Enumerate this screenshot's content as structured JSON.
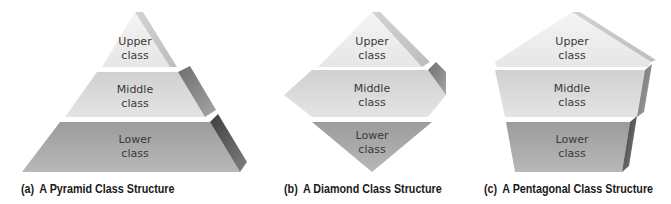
{
  "figures": [
    {
      "id": "a",
      "shape": "pyramid",
      "caption_tag": "(a)",
      "caption": "A Pyramid Class Structure",
      "tiers": [
        {
          "line1": "Upper",
          "line2": "class"
        },
        {
          "line1": "Middle",
          "line2": "class"
        },
        {
          "line1": "Lower",
          "line2": "class"
        }
      ]
    },
    {
      "id": "b",
      "shape": "diamond",
      "caption_tag": "(b)",
      "caption": "A Diamond Class Structure",
      "tiers": [
        {
          "line1": "Upper",
          "line2": "class"
        },
        {
          "line1": "Middle",
          "line2": "class"
        },
        {
          "line1": "Lower",
          "line2": "class"
        }
      ]
    },
    {
      "id": "c",
      "shape": "pentagon",
      "caption_tag": "(c)",
      "caption": "A Pentagonal Class Structure",
      "tiers": [
        {
          "line1": "Upper",
          "line2": "class"
        },
        {
          "line1": "Middle",
          "line2": "class"
        },
        {
          "line1": "Lower",
          "line2": "class"
        }
      ]
    }
  ],
  "colors": {
    "upper": "#ececec",
    "middle": "#d7d7d7",
    "lower": "#a9a9a9",
    "bevel_light": "#c6c6c6",
    "bevel_mid": "#8f8f8f",
    "bevel_dark": "#5a5a5a",
    "text": "#3a3a3a"
  }
}
